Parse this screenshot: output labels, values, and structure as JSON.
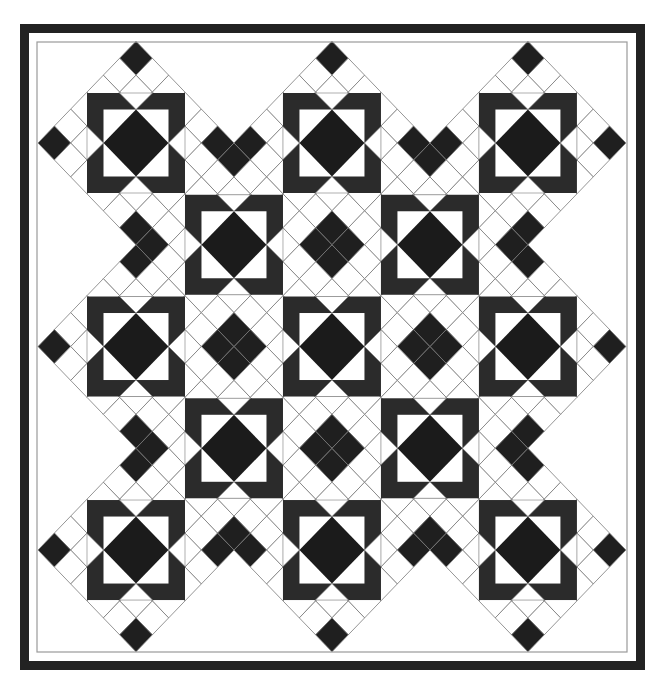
{
  "canvas": {
    "width": 661,
    "height": 685
  },
  "colors": {
    "background": "#ffffff",
    "border": "#222222",
    "inner_line": "#9a9a9a",
    "grid_line": "#7a7a7a",
    "frame": "#2b2b2b",
    "diamond": "#1b1b1b",
    "tile_dark": "#1f1f1f",
    "tile_light": "#ffffff"
  },
  "frame": {
    "outer": {
      "x": 20,
      "y": 24,
      "w": 625,
      "h": 646,
      "thickness": 9
    },
    "inner_line": {
      "x": 37,
      "y": 42,
      "w": 590,
      "h": 610
    }
  },
  "grid": {
    "origin": {
      "x": 136,
      "y": 143
    },
    "step_x": 16.33,
    "step_y": 16.96,
    "block_size_units": 6
  },
  "blocks": [
    {
      "type": "large",
      "i": 0,
      "j": 0
    },
    {
      "type": "large",
      "i": 1,
      "j": 0
    },
    {
      "type": "large",
      "i": 2,
      "j": 0
    },
    {
      "type": "large",
      "i": 0,
      "j": 1
    },
    {
      "type": "large",
      "i": 1,
      "j": 1
    },
    {
      "type": "large",
      "i": 2,
      "j": 1
    },
    {
      "type": "large",
      "i": 0,
      "j": 2
    },
    {
      "type": "large",
      "i": 1,
      "j": 2
    },
    {
      "type": "large",
      "i": 2,
      "j": 2
    },
    {
      "type": "small",
      "i": 0.5,
      "j": 0.5
    },
    {
      "type": "small",
      "i": 1.5,
      "j": 0.5
    },
    {
      "type": "small",
      "i": 0.5,
      "j": 1.5
    },
    {
      "type": "small",
      "i": 1.5,
      "j": 1.5
    }
  ],
  "block_geometry": {
    "frame_half_x": 49,
    "frame_half_y": 50,
    "window_half_x": 32.5,
    "window_half_y": 33.5,
    "notch_half_base": 16.5
  }
}
